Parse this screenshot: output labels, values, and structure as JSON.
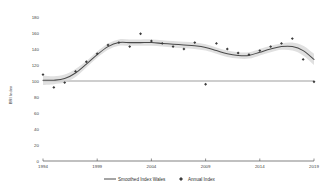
{
  "chart_data": {
    "type": "scatter",
    "title": "",
    "xlabel": "",
    "ylabel": "BRI Index",
    "xlim": [
      1994,
      2019
    ],
    "ylim": [
      0,
      180
    ],
    "grid": false,
    "legend_position": "bottom",
    "x_ticks": [
      "1994",
      "1999",
      "2004",
      "2009",
      "2014",
      "2019"
    ],
    "x_tick_values": [
      1994,
      1999,
      2004,
      2009,
      2014,
      2019
    ],
    "y_ticks": [
      "0",
      "20",
      "40",
      "60",
      "80",
      "100",
      "120",
      "140",
      "160",
      "180"
    ],
    "y_tick_values": [
      0,
      20,
      40,
      60,
      80,
      100,
      120,
      140,
      160,
      180
    ],
    "reference_line": 100,
    "series": [
      {
        "name": "Annual Index",
        "type": "scatter",
        "marker": "diamond",
        "color": "#3b3b3b",
        "x": [
          1994,
          1995,
          1996,
          1997,
          1998,
          1999,
          2000,
          2001,
          2002,
          2003,
          2004,
          2005,
          2006,
          2007,
          2008,
          2009,
          2010,
          2011,
          2012,
          2013,
          2014,
          2015,
          2016,
          2017,
          2018,
          2019
        ],
        "values": [
          108,
          92,
          98,
          112,
          124,
          134,
          145,
          148,
          143,
          159,
          150,
          147,
          143,
          140,
          148,
          96,
          147,
          140,
          135,
          133,
          138,
          143,
          147,
          153,
          127,
          99
        ]
      },
      {
        "name": "Smoothed Index Wales",
        "type": "line",
        "color": "#4a4a4a",
        "band_color": "#d9d9d9",
        "x": [
          1994,
          1995,
          1996,
          1997,
          1998,
          1999,
          2000,
          2001,
          2002,
          2003,
          2004,
          2005,
          2006,
          2007,
          2008,
          2009,
          2010,
          2011,
          2012,
          2013,
          2014,
          2015,
          2016,
          2017,
          2018,
          2019
        ],
        "values": [
          101,
          101,
          103,
          110,
          121,
          133,
          143,
          148,
          148,
          148,
          148,
          147,
          146,
          145,
          144,
          142,
          138,
          134,
          132,
          132,
          136,
          140,
          143,
          143,
          138,
          127
        ],
        "band_lower": [
          95,
          96,
          98,
          105,
          117,
          129,
          139,
          144,
          144,
          144,
          144,
          143,
          142,
          141,
          140,
          138,
          134,
          130,
          128,
          128,
          132,
          136,
          139,
          138,
          132,
          120
        ],
        "band_upper": [
          107,
          106,
          108,
          115,
          125,
          137,
          147,
          152,
          152,
          152,
          152,
          151,
          150,
          149,
          148,
          146,
          142,
          138,
          136,
          136,
          140,
          144,
          147,
          148,
          144,
          134
        ]
      }
    ]
  },
  "legend": {
    "items": [
      {
        "label": "Smoothed Index Wales",
        "marker": "line"
      },
      {
        "label": "Annual Index",
        "marker": "diamond"
      }
    ]
  },
  "axis": {
    "y_title": "BRI Index"
  }
}
